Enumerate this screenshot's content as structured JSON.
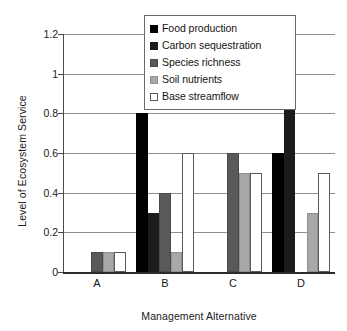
{
  "chart_data": {
    "type": "bar",
    "title": "",
    "xlabel": "Management Alternative",
    "ylabel": "Level of Ecosystem Service",
    "categories": [
      "A",
      "B",
      "C",
      "D"
    ],
    "ylim": [
      0,
      1.2
    ],
    "ytick_labels": [
      "0",
      "0.2",
      "0.4",
      "0.6",
      "0.8",
      "1",
      "1.2"
    ],
    "ytick_values": [
      0,
      0.2,
      0.4,
      0.6,
      0.8,
      1,
      1.2
    ],
    "grid": true,
    "legend_position": "upper-center",
    "series": [
      {
        "name": "Food production",
        "color": "#000000",
        "border": "#000000",
        "values": [
          0,
          0.8,
          0,
          0.6
        ]
      },
      {
        "name": "Carbon sequestration",
        "color": "#1c1c1c",
        "border": "#1c1c1c",
        "values": [
          0,
          0.3,
          0,
          0.9
        ]
      },
      {
        "name": "Species richness",
        "color": "#595959",
        "border": "#4a4a4a",
        "values": [
          0.1,
          0.4,
          0.6,
          0
        ]
      },
      {
        "name": "Soil nutrients",
        "color": "#a8a8a8",
        "border": "#8f8f8f",
        "values": [
          0.1,
          0.1,
          0.5,
          0.3
        ]
      },
      {
        "name": "Base streamflow",
        "color": "#ffffff",
        "border": "#5a5a5a",
        "values": [
          0.1,
          0.6,
          0.5,
          0.5
        ]
      }
    ]
  },
  "legend": {
    "items": [
      {
        "label": "Food production"
      },
      {
        "label": "Carbon sequestration"
      },
      {
        "label": "Species richness"
      },
      {
        "label": "Soil nutrients"
      },
      {
        "label": "Base streamflow"
      }
    ]
  }
}
